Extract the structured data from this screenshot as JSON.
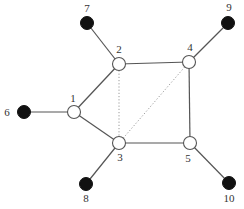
{
  "diagram": {
    "type": "graph",
    "colors": {
      "hub_fill": "#ffffff",
      "hub_stroke": "#555555",
      "leaf_fill": "#111111",
      "edge": "#555555",
      "dotted_edge": "#9a9a9a"
    },
    "nodes": [
      {
        "id": "1",
        "label": "1",
        "kind": "hub",
        "x": 74,
        "y": 112,
        "lx": 73,
        "ly": 99
      },
      {
        "id": "2",
        "label": "2",
        "kind": "hub",
        "x": 119,
        "y": 64,
        "lx": 119,
        "ly": 50
      },
      {
        "id": "3",
        "label": "3",
        "kind": "hub",
        "x": 119,
        "y": 143,
        "lx": 120,
        "ly": 158
      },
      {
        "id": "4",
        "label": "4",
        "kind": "hub",
        "x": 189,
        "y": 62,
        "lx": 190,
        "ly": 48
      },
      {
        "id": "5",
        "label": "5",
        "kind": "hub",
        "x": 190,
        "y": 143,
        "lx": 188,
        "ly": 159
      },
      {
        "id": "6",
        "label": "6",
        "kind": "leaf",
        "x": 24,
        "y": 112,
        "lx": 7,
        "ly": 113
      },
      {
        "id": "7",
        "label": "7",
        "kind": "leaf",
        "x": 87,
        "y": 23,
        "lx": 87,
        "ly": 9
      },
      {
        "id": "8",
        "label": "8",
        "kind": "leaf",
        "x": 86,
        "y": 184,
        "lx": 86,
        "ly": 199
      },
      {
        "id": "9",
        "label": "9",
        "kind": "leaf",
        "x": 228,
        "y": 23,
        "lx": 229,
        "ly": 8
      },
      {
        "id": "10",
        "label": "10",
        "kind": "leaf",
        "x": 229,
        "y": 183,
        "lx": 229,
        "ly": 199
      }
    ],
    "edges": [
      {
        "from": "1",
        "to": "6",
        "style": "solid"
      },
      {
        "from": "1",
        "to": "2",
        "style": "solid"
      },
      {
        "from": "1",
        "to": "3",
        "style": "solid"
      },
      {
        "from": "2",
        "to": "7",
        "style": "solid"
      },
      {
        "from": "2",
        "to": "4",
        "style": "solid"
      },
      {
        "from": "2",
        "to": "3",
        "style": "dotted"
      },
      {
        "from": "3",
        "to": "4",
        "style": "dotted"
      },
      {
        "from": "3",
        "to": "5",
        "style": "solid"
      },
      {
        "from": "3",
        "to": "8",
        "style": "solid"
      },
      {
        "from": "4",
        "to": "5",
        "style": "solid"
      },
      {
        "from": "4",
        "to": "9",
        "style": "solid"
      },
      {
        "from": "5",
        "to": "10",
        "style": "solid"
      }
    ]
  }
}
